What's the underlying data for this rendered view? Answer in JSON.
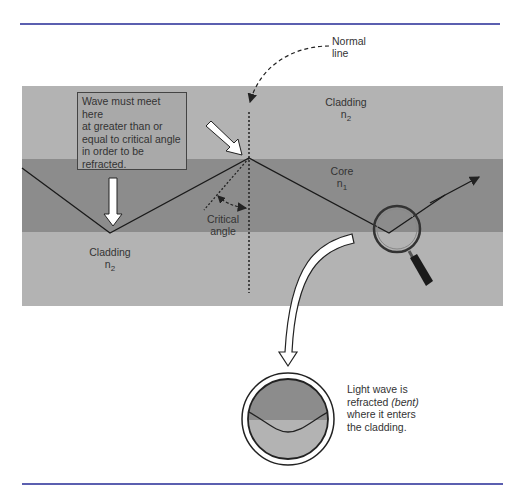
{
  "figure": {
    "type": "fiber-optic-refraction-diagram",
    "colors": {
      "rule": "#5b5fb0",
      "cladding": "#b3b3b3",
      "core": "#8c8c8c",
      "line": "#222222",
      "arrow_fill": "#ffffff"
    },
    "labels": {
      "normal_line_1": "Normal",
      "normal_line_2": "line",
      "cladding_top": "Cladding",
      "cladding_top_index": "n",
      "cladding_top_sub": "2",
      "core": "Core",
      "core_index": "n",
      "core_sub": "1",
      "cladding_bottom": "Cladding",
      "cladding_bottom_index": "n",
      "cladding_bottom_sub": "2",
      "critical_1": "Critical",
      "critical_2": "angle"
    },
    "note": {
      "lines": [
        "Wave must meet here",
        "at greater than or",
        "equal to critical angle",
        "in order to be",
        "refracted."
      ]
    },
    "caption": {
      "part1": "Light wave is",
      "part2a": "refracted ",
      "part2b": "(bent)",
      "part3": "where it enters",
      "part4": "the cladding."
    },
    "icons": [
      "magnifier-icon",
      "down-arrow-icon",
      "diagonal-arrow-icon",
      "curved-arrow-icon",
      "zoom-circle-icon"
    ]
  }
}
